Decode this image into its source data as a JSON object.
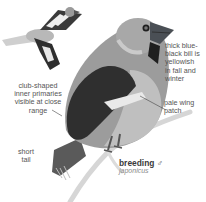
{
  "plate": {
    "subject": "Hawfinch",
    "colors": {
      "background": "#ffffff",
      "label_text": "#555555",
      "caption_sub": "#8a8a8a",
      "body_gray": "#8a8a8a",
      "dark_wing": "#2b2b2b",
      "bill": "#4a4f55"
    },
    "callouts": {
      "bill": [
        "thick blue-",
        "black bill is",
        "yellowish",
        "in fall and",
        "winter"
      ],
      "wing_patch": [
        "pale wing",
        "patch"
      ],
      "primaries": [
        "club-shaped",
        "inner primaries",
        "visible at close",
        "range"
      ],
      "tail": [
        "short",
        "tail"
      ]
    },
    "caption": {
      "title": "breeding",
      "sex_symbol": "♂",
      "subspecies": "japonicus"
    }
  }
}
